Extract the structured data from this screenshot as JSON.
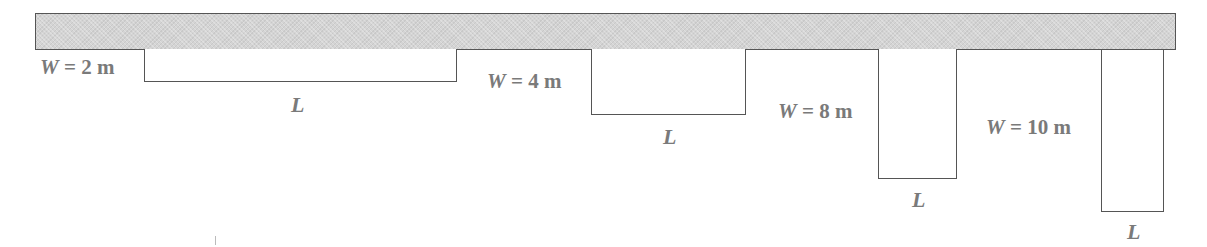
{
  "diagram": {
    "beam": {
      "label": "",
      "fill": "#d4d4d4"
    },
    "plates": [
      {
        "width_label_var": "W",
        "width_label_rest": " = 2 m",
        "length_label": "L"
      },
      {
        "width_label_var": "W",
        "width_label_rest": " = 4 m",
        "length_label": "L"
      },
      {
        "width_label_var": "W",
        "width_label_rest": " = 8 m",
        "length_label": "L"
      },
      {
        "width_label_var": "W",
        "width_label_rest": " = 10 m",
        "length_label": "L"
      }
    ],
    "text_color": "#7a7a7a",
    "line_color": "#555555"
  }
}
